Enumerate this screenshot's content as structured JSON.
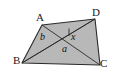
{
  "figure": {
    "type": "geometry-diagram",
    "fill_color": "#b8b8b8",
    "stroke_color": "#2a2a2a",
    "background_color": "#ffffff",
    "vertices": [
      {
        "name": "A",
        "label": "A",
        "x": 42,
        "y": 25
      },
      {
        "name": "D",
        "label": "D",
        "x": 95,
        "y": 19
      },
      {
        "name": "C",
        "label": "C",
        "x": 100,
        "y": 65
      },
      {
        "name": "B",
        "label": "B",
        "x": 22,
        "y": 63
      }
    ],
    "edges": [
      {
        "name": "AD",
        "from": "A",
        "to": "D"
      },
      {
        "name": "DC",
        "from": "D",
        "to": "C"
      },
      {
        "name": "CB",
        "from": "C",
        "to": "B"
      },
      {
        "name": "BA",
        "from": "B",
        "to": "A"
      }
    ],
    "diagonals": [
      {
        "name": "AC",
        "from": "A",
        "to": "C"
      },
      {
        "name": "BD",
        "from": "B",
        "to": "D"
      }
    ],
    "angle_labels": [
      {
        "name": "angle-b",
        "text": "b",
        "x": 40,
        "y": 32
      },
      {
        "name": "angle-x",
        "text": "x",
        "x": 71,
        "y": 32
      },
      {
        "name": "angle-a",
        "text": "a",
        "x": 62,
        "y": 44
      }
    ],
    "tick_mark": {
      "name": "angle-x-tick",
      "x1": 69,
      "y1": 28,
      "x2": 69,
      "y2": 36
    }
  }
}
